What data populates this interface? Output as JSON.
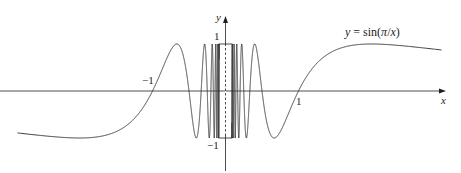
{
  "chart_data": {
    "type": "line",
    "title": "",
    "function_label": "y = sin(π/x)",
    "function_label_parts": {
      "lhs": "y",
      "eq": " = sin(",
      "pi": "π",
      "slash": "/",
      "x": "x",
      "close": ")"
    },
    "xlabel": "x",
    "ylabel": "y",
    "x_ticks": [
      {
        "value": -1,
        "label": "−1"
      },
      {
        "value": 1,
        "label": "1"
      }
    ],
    "y_ticks": [
      {
        "value": 1,
        "label": "1"
      },
      {
        "value": -1,
        "label": "−1"
      }
    ],
    "xlim": [
      -2.85,
      2.96
    ],
    "ylim": [
      -1,
      1
    ],
    "grid": false,
    "legend": "none",
    "annotations": [
      "dashed box around x≈0 indicating infinitely many oscillations"
    ],
    "series": [
      {
        "name": "sin(pi/x)",
        "expression": "sin(pi/x)",
        "x": [
          -2.85,
          -2.5,
          -2.0,
          -1.5,
          -1.2,
          -1.0,
          -0.8,
          -0.667,
          -0.571,
          -0.5,
          -0.4,
          -0.333,
          -0.286,
          -0.25,
          0.25,
          0.286,
          0.333,
          0.4,
          0.5,
          0.571,
          0.667,
          0.8,
          1.0,
          1.2,
          1.5,
          2.0,
          2.5,
          2.96
        ],
        "y": [
          -0.89,
          -0.95,
          -1.0,
          -0.87,
          -0.5,
          0.0,
          0.71,
          1.0,
          0.0,
          0.0,
          -1.0,
          0.0,
          0.0,
          0.0,
          0.0,
          0.0,
          0.0,
          1.0,
          0.0,
          0.0,
          -1.0,
          -0.71,
          0.0,
          0.5,
          0.87,
          1.0,
          0.95,
          0.89
        ]
      }
    ]
  },
  "style": {
    "curve_color": "#3a3a3a",
    "axis_color": "#231f20",
    "box_color": "#231f20"
  }
}
